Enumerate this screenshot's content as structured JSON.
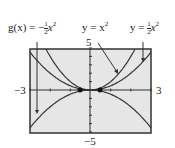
{
  "chart_data": {
    "type": "line",
    "title": "",
    "xlabel": "",
    "ylabel": "",
    "xlim": [
      -3,
      3
    ],
    "ylim": [
      -5,
      5
    ],
    "x_tick_labels": [
      "-3",
      "3"
    ],
    "y_tick_labels": [
      "5",
      "-5"
    ],
    "grid": false,
    "series": [
      {
        "name": "g(x) = -1/2 x^2",
        "expr": "-0.5*x^2"
      },
      {
        "name": "y = x^2",
        "expr": "x^2"
      },
      {
        "name": "y = 1/2 x^2",
        "expr": "0.5*x^2"
      }
    ],
    "annotations": [
      {
        "text": "g(x) = -½x²",
        "points_to": "g(x) = -1/2 x^2"
      },
      {
        "text": "y = x²",
        "points_to": "y = x^2"
      },
      {
        "text": "y = ½x²",
        "points_to": "y = 1/2 x^2"
      }
    ]
  },
  "labels": {
    "g_prefix": "g(x) = −",
    "y_eq": "y = x",
    "y_half_prefix": "y = ",
    "half_num": "1",
    "half_den": "2",
    "x_var": "x",
    "exp": "2",
    "ymax": "5",
    "ymin": "−5",
    "xmin": "−3",
    "xmax": "3"
  }
}
